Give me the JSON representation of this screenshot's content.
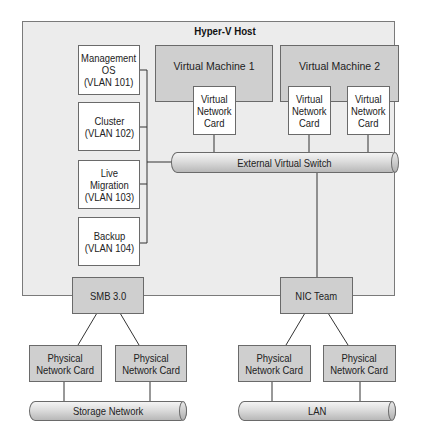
{
  "diagram": {
    "host": {
      "title": "Hyper-V Host"
    },
    "vlan_adapters": [
      {
        "label": "Management\nOS\n(VLAN 101)"
      },
      {
        "label": "Cluster\n(VLAN 102)"
      },
      {
        "label": "Live\nMigration\n(VLAN 103)"
      },
      {
        "label": "Backup\n(VLAN 104)"
      }
    ],
    "virtual_machines": [
      {
        "label": "Virtual Machine 1",
        "nics": [
          {
            "label": "Virtual\nNetwork\nCard"
          }
        ]
      },
      {
        "label": "Virtual Machine 2",
        "nics": [
          {
            "label": "Virtual\nNetwork\nCard"
          },
          {
            "label": "Virtual\nNetwork\nCard"
          }
        ]
      }
    ],
    "virtual_switch": {
      "label": "External Virtual Switch"
    },
    "smb": {
      "label": "SMB 3.0"
    },
    "nic_team": {
      "label": "NIC Team"
    },
    "storage_side": {
      "physical_cards": [
        {
          "label": "Physical\nNetwork Card"
        },
        {
          "label": "Physical\nNetwork Card"
        }
      ],
      "network": {
        "label": "Storage Network"
      }
    },
    "lan_side": {
      "physical_cards": [
        {
          "label": "Physical\nNetwork Card"
        },
        {
          "label": "Physical\nNetwork Card"
        }
      ],
      "network": {
        "label": "LAN"
      }
    },
    "colors": {
      "host_fill": "#ececec",
      "box_fill_grey": "#cfcfcf",
      "box_fill_white": "#ffffff",
      "stroke": "#6a6a6a",
      "line": "#333333"
    }
  }
}
